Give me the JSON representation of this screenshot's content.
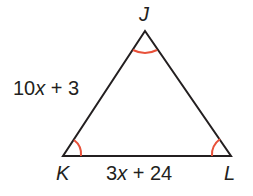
{
  "diagram": {
    "type": "triangle",
    "vertices": [
      {
        "name": "J",
        "x": 145,
        "y": 31
      },
      {
        "name": "K",
        "x": 63,
        "y": 156
      },
      {
        "name": "L",
        "x": 231,
        "y": 156
      }
    ],
    "side_labels": {
      "JK": "10x + 3",
      "KL": "3x + 24"
    },
    "angle_marks": [
      "J",
      "K",
      "L"
    ],
    "colors": {
      "stroke": "#231f20",
      "angle_mark": "#e8513a"
    }
  },
  "labels": {
    "J": "J",
    "K": "K",
    "L": "L",
    "side_jk_coef": "10",
    "side_jk_var": "x",
    "side_jk_rest": " + 3",
    "side_kl_coef": "3",
    "side_kl_var": "x",
    "side_kl_rest": " + 24"
  }
}
